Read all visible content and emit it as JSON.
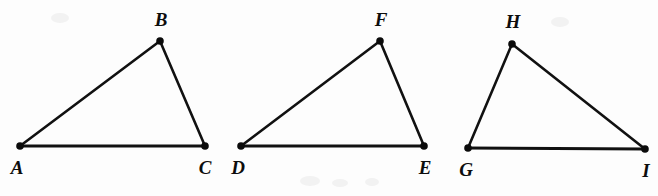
{
  "figure": {
    "kind": "geometry-figure",
    "canvas": {
      "width": 658,
      "height": 196
    },
    "background_color": "#fdfdfd",
    "ink_color": "#111111",
    "label_color": "#0d0d0d",
    "stroke_width": 2.6,
    "vertex_dot_radius": 3.6,
    "triangles": [
      {
        "id": "triangle-abc",
        "name": "Triangle ABC",
        "vertices": [
          {
            "label": "A",
            "x": 20,
            "y": 146,
            "label_x": 17,
            "label_y": 174
          },
          {
            "label": "B",
            "x": 160,
            "y": 41,
            "label_x": 161,
            "label_y": 26
          },
          {
            "label": "C",
            "x": 205,
            "y": 146,
            "label_x": 205,
            "label_y": 174
          }
        ],
        "edges": [
          {
            "name": "side-AB",
            "from": "A",
            "to": "B"
          },
          {
            "name": "side-BC",
            "from": "B",
            "to": "C"
          },
          {
            "name": "side-CA",
            "from": "C",
            "to": "A"
          }
        ]
      },
      {
        "id": "triangle-def",
        "name": "Triangle DEF",
        "vertices": [
          {
            "label": "D",
            "x": 241,
            "y": 146,
            "label_x": 238,
            "label_y": 174
          },
          {
            "label": "F",
            "x": 380,
            "y": 41,
            "label_x": 381,
            "label_y": 26
          },
          {
            "label": "E",
            "x": 424,
            "y": 146,
            "label_x": 425,
            "label_y": 174
          }
        ],
        "edges": [
          {
            "name": "side-DF",
            "from": "D",
            "to": "F"
          },
          {
            "name": "side-FE",
            "from": "F",
            "to": "E"
          },
          {
            "name": "side-ED",
            "from": "E",
            "to": "D"
          }
        ]
      },
      {
        "id": "triangle-ghi",
        "name": "Triangle GHI",
        "vertices": [
          {
            "label": "G",
            "x": 468,
            "y": 148,
            "label_x": 466,
            "label_y": 176
          },
          {
            "label": "H",
            "x": 512,
            "y": 44,
            "label_x": 513,
            "label_y": 28
          },
          {
            "label": "I",
            "x": 645,
            "y": 149,
            "label_x": 646,
            "label_y": 177
          }
        ],
        "edges": [
          {
            "name": "side-GH",
            "from": "G",
            "to": "H"
          },
          {
            "name": "side-HI",
            "from": "H",
            "to": "I"
          },
          {
            "name": "side-IG",
            "from": "I",
            "to": "G"
          }
        ]
      }
    ],
    "labels": {
      "a": "A",
      "b": "B",
      "c": "C",
      "d": "D",
      "e": "E",
      "f": "F",
      "g": "G",
      "h": "H",
      "i": "I"
    }
  }
}
